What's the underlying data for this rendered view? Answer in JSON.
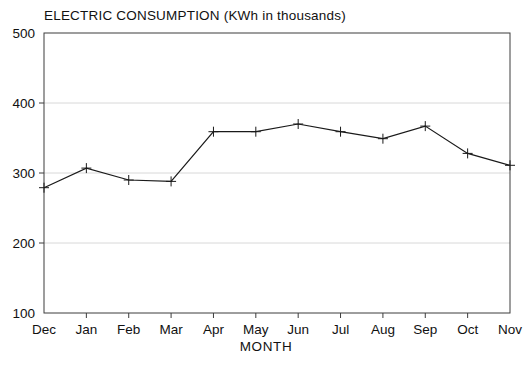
{
  "chart_data": {
    "type": "line",
    "title": "ELECTRIC CONSUMPTION (KWh in thousands)",
    "xlabel": "MONTH",
    "ylabel": "",
    "categories": [
      "Dec",
      "Jan",
      "Feb",
      "Mar",
      "Apr",
      "May",
      "Jun",
      "Jul",
      "Aug",
      "Sep",
      "Oct",
      "Nov"
    ],
    "values": [
      279,
      307,
      290,
      288,
      359,
      359,
      370,
      359,
      349,
      367,
      328,
      311
    ],
    "ylim": [
      100,
      500
    ],
    "y_ticks": [
      100,
      200,
      300,
      400,
      500
    ],
    "x_ticks": [
      "Dec",
      "Jan",
      "Feb",
      "Mar",
      "Apr",
      "May",
      "Jun",
      "Jul",
      "Aug",
      "Sep",
      "Oct",
      "Nov"
    ],
    "grid": true,
    "legend": false,
    "marker": "plus",
    "line_color": "#1a1a1a",
    "grid_color": "#d8d8d8",
    "frame_color": "#3c3c3c"
  }
}
